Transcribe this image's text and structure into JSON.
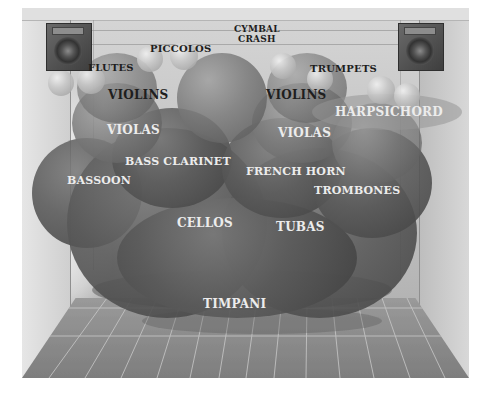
{
  "figure": {
    "colors": {
      "background": "#ffffff",
      "stage": "#c4c4c4",
      "floor": "#8a8a8a",
      "grid": "#c8c8c8",
      "dark_label": "#1e1e1e",
      "light_label": "#ececec"
    },
    "speakers": [
      {
        "name": "left-speaker",
        "icon": "speaker-icon"
      },
      {
        "name": "right-speaker",
        "icon": "speaker-icon"
      }
    ],
    "labels": {
      "cymbal_crash_1": "CYMBAL",
      "cymbal_crash_2": "CRASH",
      "piccolos": "PICCOLOS",
      "flutes": "FLUTES",
      "trumpets": "TRUMPETS",
      "violins_left": "VIOLINS",
      "violins_right": "VIOLINS",
      "violas_left": "VIOLAS",
      "violas_right": "VIOLAS",
      "harpsichord": "HARPSICHORD",
      "bass_clarinet": "BASS CLARINET",
      "french_horn": "FRENCH HORN",
      "bassoon": "BASSOON",
      "trombones": "TROMBONES",
      "cellos": "CELLOS",
      "tubas": "TUBAS",
      "timpani": "TIMPANI"
    }
  }
}
